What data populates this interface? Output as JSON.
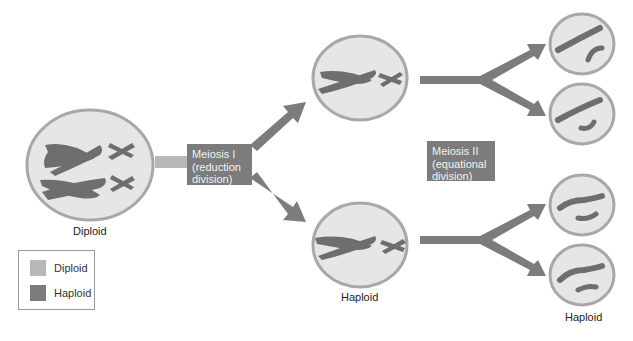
{
  "colors": {
    "diploid": "#b8b8b8",
    "haploid": "#7c7c7c",
    "cell_fill": "#e6e6e6",
    "cell_border": "#a8a8a8",
    "chromosome": "#6e6e6e",
    "box_text": "#f2f2f2"
  },
  "stages": {
    "start": {
      "label": "Diploid"
    },
    "after_meiosis_1": {
      "label": "Haploid"
    },
    "after_meiosis_2": {
      "label": "Haploid"
    }
  },
  "processes": {
    "meiosis_1": {
      "title": "Meiosis I",
      "line2": "(reduction",
      "line3": "division)"
    },
    "meiosis_2": {
      "title": "Meiosis II",
      "line2": "(equational",
      "line3": "division)"
    }
  },
  "legend": {
    "items": [
      {
        "label": "Diploid",
        "color": "#b8b8b8"
      },
      {
        "label": "Haploid",
        "color": "#7c7c7c"
      }
    ]
  }
}
